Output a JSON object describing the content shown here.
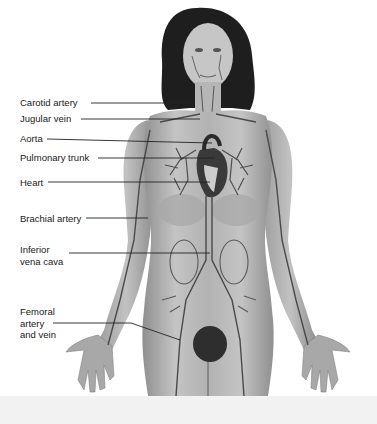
{
  "diagram": {
    "style": "grayscale anatomical illustration",
    "colors": {
      "background": "#ffffff",
      "skin": "#b8b8b8",
      "hair": "#1e1e1e",
      "vessels": "#4a4a4a",
      "heart": "#3a3a3a",
      "label_text": "#1a1a1a",
      "leader_line": "#222222"
    },
    "labels": [
      {
        "id": "carotid",
        "text": "Carotid artery",
        "x": 20,
        "y": 97,
        "line": [
          [
            91,
            103
          ],
          [
            193,
            103
          ]
        ]
      },
      {
        "id": "jugular",
        "text": "Jugular vein",
        "x": 20,
        "y": 113,
        "line": [
          [
            81,
            119
          ],
          [
            200,
            119
          ]
        ]
      },
      {
        "id": "aorta",
        "text": "Aorta",
        "x": 20,
        "y": 133,
        "line": [
          [
            47,
            139
          ],
          [
            212,
            143
          ]
        ]
      },
      {
        "id": "pulmonary",
        "text": "Pulmonary trunk",
        "x": 20,
        "y": 152,
        "line": [
          [
            98,
            158
          ],
          [
            215,
            158
          ]
        ]
      },
      {
        "id": "heart",
        "text": "Heart",
        "x": 20,
        "y": 177,
        "line": [
          [
            48,
            182
          ],
          [
            210,
            182
          ]
        ]
      },
      {
        "id": "brachial",
        "text": "Brachial artery",
        "x": 20,
        "y": 213,
        "line": [
          [
            86,
            218
          ],
          [
            148,
            218
          ]
        ]
      },
      {
        "id": "ivc",
        "text": "Inferior\nvena cava",
        "lines": [
          "Inferior",
          "vena cava"
        ],
        "x": 20,
        "y": 244,
        "line": [
          [
            69,
            253
          ],
          [
            210,
            253
          ]
        ]
      },
      {
        "id": "femoral",
        "text": "Femoral\nartery\nand vein",
        "lines": [
          "Femoral",
          "artery",
          "and vein"
        ],
        "x": 20,
        "y": 306,
        "line": [
          [
            53,
            323
          ],
          [
            131,
            323
          ],
          [
            180,
            340
          ]
        ]
      }
    ]
  }
}
